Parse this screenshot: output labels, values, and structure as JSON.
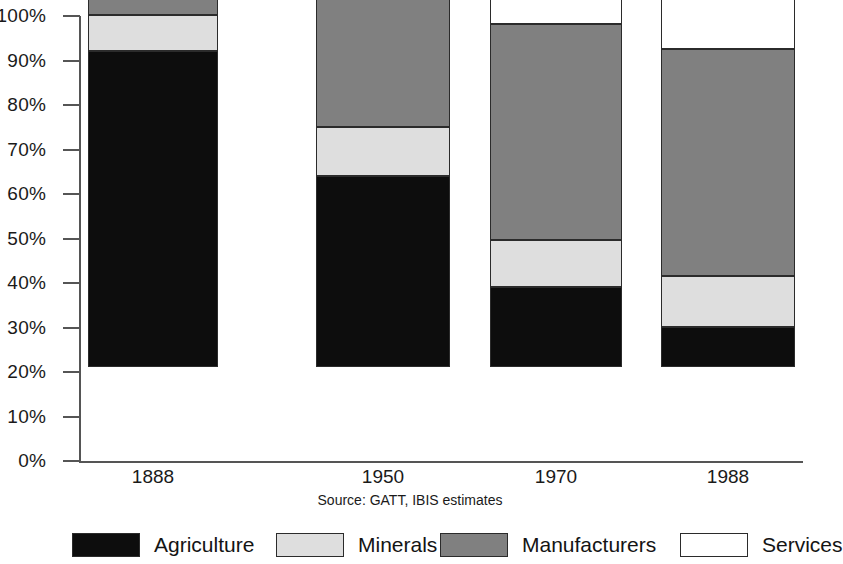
{
  "chart_data": {
    "type": "bar",
    "subtype": "stacked-100-percent",
    "title": "",
    "xlabel": "",
    "ylabel": "",
    "categories": [
      "1888",
      "1950",
      "1970",
      "1988"
    ],
    "ylim": [
      0,
      100
    ],
    "y_tick_labels": [
      "0%",
      "10%",
      "20%",
      "30%",
      "40%",
      "50%",
      "60%",
      "70%",
      "80%",
      "90%",
      "100%"
    ],
    "y_tick_values": [
      0,
      10,
      20,
      30,
      40,
      50,
      60,
      70,
      80,
      90,
      100
    ],
    "grid": false,
    "legend_position": "bottom",
    "source_note": "Source: GATT, IBIS estimates",
    "series": [
      {
        "name": "Agriculture",
        "color": "#0d0d0d",
        "values": [
          71,
          43,
          18,
          9
        ]
      },
      {
        "name": "Minerals",
        "color": "#dedede",
        "values": [
          8,
          11,
          10.5,
          11.5
        ]
      },
      {
        "name": "Manufacturers",
        "color": "#808080",
        "values": [
          7.5,
          36.8,
          48.5,
          51
        ]
      },
      {
        "name": "Services",
        "color": "#ffffff",
        "values": [
          13.5,
          9.2,
          23,
          28.5
        ]
      }
    ],
    "cumulative_tops": {
      "1888": {
        "Agriculture": 71,
        "Minerals": 79,
        "Manufacturers": 86.5,
        "Services": 100
      },
      "1950": {
        "Agriculture": 43,
        "Minerals": 54,
        "Manufacturers": 90.8,
        "Services": 100
      },
      "1970": {
        "Agriculture": 18,
        "Minerals": 28.5,
        "Manufacturers": 77,
        "Services": 100
      },
      "1988": {
        "Agriculture": 9,
        "Minerals": 20.5,
        "Manufacturers": 71.5,
        "Services": 100
      }
    }
  },
  "legend": {
    "items": [
      {
        "label": "Agriculture",
        "color": "#0d0d0d"
      },
      {
        "label": "Minerals",
        "color": "#dedede"
      },
      {
        "label": "Manufacturers",
        "color": "#808080"
      },
      {
        "label": "Services",
        "color": "#ffffff"
      }
    ]
  }
}
